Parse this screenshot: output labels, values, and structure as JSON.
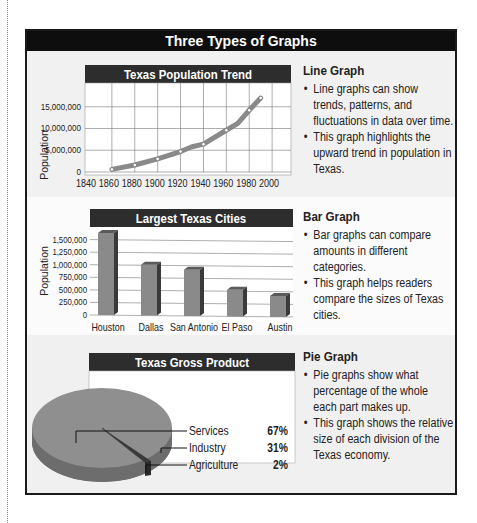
{
  "page_title": "Three Types of Graphs",
  "sections": [
    {
      "heading": "Line Graph",
      "bullets": [
        "Line graphs can show trends, patterns, and fluctuations in data over time.",
        "This graph highlights the upward trend in population in Texas."
      ]
    },
    {
      "heading": "Bar Graph",
      "bullets": [
        "Bar graphs can compare amounts in different categories.",
        "This graph helps readers compare the sizes of Texas cities."
      ]
    },
    {
      "heading": "Pie Graph",
      "bullets": [
        "Pie graphs show what percentage of the whole each part makes up.",
        "This graph shows the relative size of each division of the Texas economy."
      ]
    }
  ],
  "chart_data": [
    {
      "type": "line",
      "title": "Texas Population Trend",
      "xlabel": "",
      "ylabel": "Population",
      "x": [
        1860,
        1880,
        1900,
        1920,
        1930,
        1940,
        1960,
        1970,
        1980,
        1990
      ],
      "values": [
        600000,
        1600000,
        3000000,
        4700000,
        5800000,
        6400000,
        9600000,
        11200000,
        14200000,
        17000000
      ],
      "x_ticks": [
        "1840",
        "1860",
        "1880",
        "1900",
        "1920",
        "1940",
        "1960",
        "1980",
        "2000"
      ],
      "y_ticks": [
        "0",
        "5,000,000",
        "10,000,000",
        "15,000,000"
      ],
      "xlim": [
        1840,
        2020
      ],
      "ylim": [
        0,
        20000000
      ],
      "grid": true,
      "legend": null
    },
    {
      "type": "bar",
      "title": "Largest Texas Cities",
      "xlabel": "",
      "ylabel": "Population",
      "categories": [
        "Houston",
        "Dallas",
        "San Antonio",
        "El Paso",
        "Austin"
      ],
      "values": [
        1630000,
        1000000,
        900000,
        500000,
        380000
      ],
      "y_ticks": [
        "0",
        "250,000",
        "500,000",
        "750,000",
        "1,000,000",
        "1,250,000",
        "1,500,000"
      ],
      "ylim": [
        0,
        1750000
      ],
      "grid": true,
      "legend": null
    },
    {
      "type": "pie",
      "title": "Texas Gross Product",
      "categories": [
        "Services",
        "Industry",
        "Agriculture"
      ],
      "values": [
        67,
        31,
        2
      ],
      "value_labels": [
        "67%",
        "31%",
        "2%"
      ],
      "legend": "right, leader lines"
    }
  ]
}
